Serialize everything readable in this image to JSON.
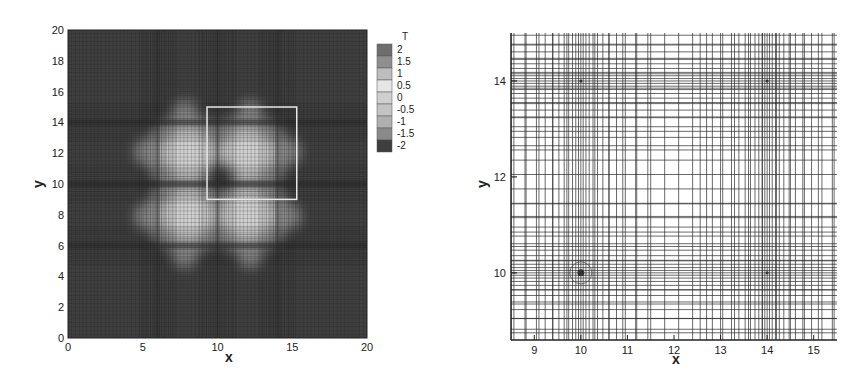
{
  "chart_data": [
    {
      "type": "heatmap",
      "title": "",
      "xlabel": "x",
      "ylabel": "y",
      "xlim": [
        0,
        20
      ],
      "ylim": [
        0,
        20
      ],
      "xticks": [
        0,
        5,
        10,
        15,
        20
      ],
      "yticks": [
        0,
        2,
        4,
        6,
        8,
        10,
        12,
        14,
        16,
        18,
        20
      ],
      "colorbar": {
        "title": "T",
        "levels": [
          2,
          1.5,
          1,
          0.5,
          0,
          -0.5,
          -1,
          -1.5,
          -2
        ],
        "labels": [
          "2",
          "1.5",
          "1",
          "0.5",
          "0",
          "-0.5",
          "-1",
          "-1.5",
          "-2"
        ],
        "colors": [
          "#6e6e6e",
          "#8f8f8f",
          "#bdbdbd",
          "#e6e6e6",
          "#cfcfcf",
          "#c4c4c4",
          "#b0b0b0",
          "#8a8a8a",
          "#3e3e3e"
        ]
      },
      "field_description": "Four-lobed (clover) positive-T region centered near (10,10), background ~-2",
      "lobes": [
        {
          "cx": 8.0,
          "cy": 12.0
        },
        {
          "cx": 12.0,
          "cy": 12.0
        },
        {
          "cx": 8.0,
          "cy": 8.0
        },
        {
          "cx": 12.0,
          "cy": 8.0
        }
      ],
      "highlight_box": {
        "x0": 9.3,
        "x1": 15.3,
        "y0": 9.0,
        "y1": 15.0
      }
    },
    {
      "type": "scatter",
      "title": "Mesh detail",
      "xlabel": "x",
      "ylabel": "y",
      "xlim": [
        8.5,
        15.5
      ],
      "ylim": [
        8.6,
        15.0
      ],
      "xticks": [
        9,
        10,
        11,
        12,
        13,
        14,
        15
      ],
      "yticks": [
        10,
        12,
        14
      ],
      "refinement_points": [
        {
          "x": 10,
          "y": 10,
          "marked": true
        },
        {
          "x": 10,
          "y": 14,
          "marked": false
        },
        {
          "x": 14,
          "y": 14,
          "marked": false
        },
        {
          "x": 14,
          "y": 10,
          "marked": false
        }
      ]
    }
  ]
}
